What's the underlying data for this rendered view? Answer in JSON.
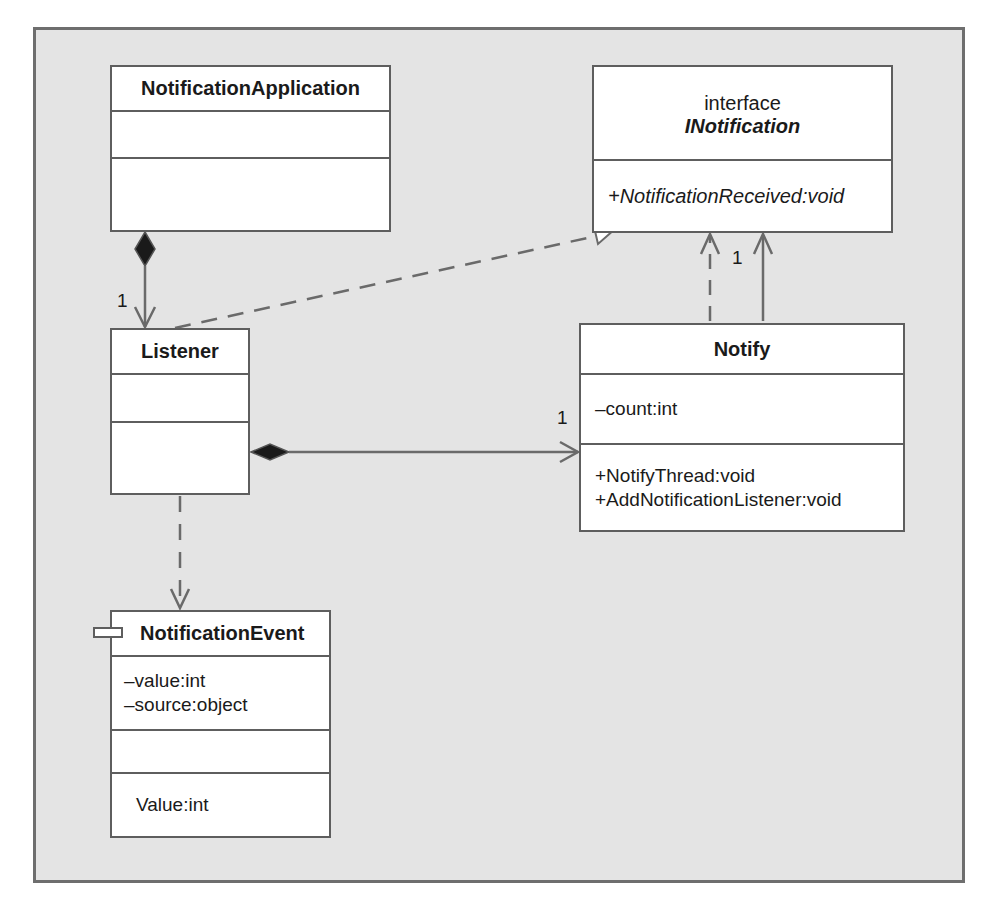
{
  "diagram": {
    "type": "UML class diagram",
    "classes": {
      "notification_application": {
        "name": "NotificationApplication",
        "attributes": [],
        "operations": []
      },
      "inotification": {
        "stereotype": "interface",
        "name": "INotification",
        "operations": [
          "+NotificationReceived:void"
        ]
      },
      "listener": {
        "name": "Listener",
        "attributes": [],
        "operations": []
      },
      "notify": {
        "name": "Notify",
        "attributes": [
          "–count:int"
        ],
        "operations": [
          "+NotifyThread:void",
          "+AddNotificationListener:void"
        ]
      },
      "notification_event": {
        "name": "NotificationEvent",
        "attributes": [
          "–value:int",
          "–source:object"
        ],
        "operations": [],
        "properties": [
          "Value:int"
        ]
      }
    },
    "relationships": [
      {
        "from": "NotificationApplication",
        "to": "Listener",
        "kind": "composition",
        "multiplicity": "1"
      },
      {
        "from": "Listener",
        "to": "INotification",
        "kind": "realization"
      },
      {
        "from": "Listener",
        "to": "Notify",
        "kind": "composition",
        "multiplicity": "1"
      },
      {
        "from": "Notify",
        "to": "INotification",
        "kind": "dependency"
      },
      {
        "from": "Notify",
        "to": "INotification",
        "kind": "association",
        "multiplicity": "1"
      },
      {
        "from": "Listener",
        "to": "NotificationEvent",
        "kind": "dependency"
      }
    ],
    "multiplicities": {
      "app_listener": "1",
      "listener_notify": "1",
      "notify_interface": "1"
    },
    "colors": {
      "background": "#e4e4e4",
      "frame_border": "#6e6e6e",
      "box_fill": "#ffffff",
      "line": "#6a6a6a",
      "diamond": "#1a1a1a"
    }
  }
}
